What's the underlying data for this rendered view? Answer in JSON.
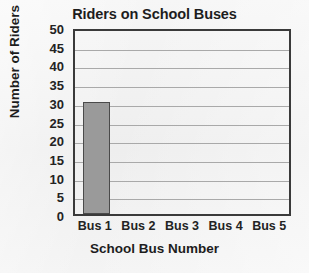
{
  "chart_data": {
    "type": "bar",
    "title": "Riders on School Buses",
    "xlabel": "School Bus Number",
    "ylabel": "Number of Riders",
    "categories": [
      "Bus 1",
      "Bus 2",
      "Bus 3",
      "Bus 4",
      "Bus 5"
    ],
    "values": [
      30,
      0,
      0,
      0,
      0
    ],
    "ylim": [
      0,
      50
    ],
    "ytick_step": 5,
    "yticks": [
      50,
      45,
      40,
      35,
      30,
      25,
      20,
      15,
      10,
      5,
      0
    ],
    "grid": true,
    "legend": false,
    "colors": {
      "bar_fill": "#9a9a9a",
      "bar_edge": "#4a4a4a",
      "frame": "#3a3a3a",
      "gridline": "#a9a9a9",
      "text": "#1d1d1d",
      "background": "#f2f2f2"
    }
  }
}
